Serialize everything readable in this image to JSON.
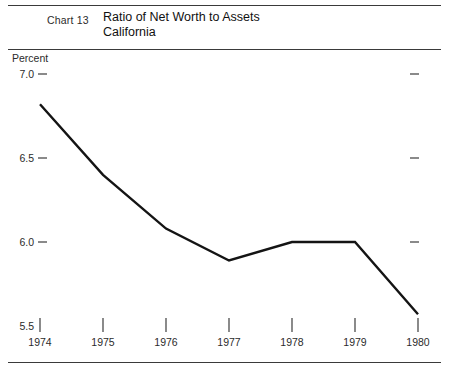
{
  "header": {
    "chart_number": "Chart 13",
    "title_line1": "Ratio of Net Worth to Assets",
    "title_line2": "California"
  },
  "axis": {
    "unit_label": "Percent",
    "y_ticks": [
      "7.0",
      "6.5",
      "6.0",
      "5.5"
    ],
    "x_ticks": [
      "1974",
      "1975",
      "1976",
      "1977",
      "1978",
      "1979",
      "1980"
    ]
  },
  "colors": {
    "line": "#141414",
    "rule": "#3a3a3a",
    "text": "#1a1a1a",
    "background": "#ffffff"
  },
  "chart_data": {
    "type": "line",
    "title": "Ratio of Net Worth to Assets",
    "subtitle": "California",
    "xlabel": "",
    "ylabel": "Percent",
    "x": [
      1974,
      1975,
      1976,
      1977,
      1978,
      1979,
      1980
    ],
    "categories": [
      "1974",
      "1975",
      "1976",
      "1977",
      "1978",
      "1979",
      "1980"
    ],
    "values": [
      6.82,
      6.4,
      6.08,
      5.89,
      6.0,
      6.0,
      5.57
    ],
    "series": [
      {
        "name": "Ratio of Net Worth to Assets",
        "values": [
          6.82,
          6.4,
          6.08,
          5.89,
          6.0,
          6.0,
          5.57
        ]
      }
    ],
    "ylim": [
      5.5,
      7.0
    ],
    "yticks": [
      5.5,
      6.0,
      6.5,
      7.0
    ],
    "ytick_labels": [
      "5.5",
      "6.0",
      "6.5",
      "7.0"
    ],
    "grid": false,
    "legend": false
  }
}
